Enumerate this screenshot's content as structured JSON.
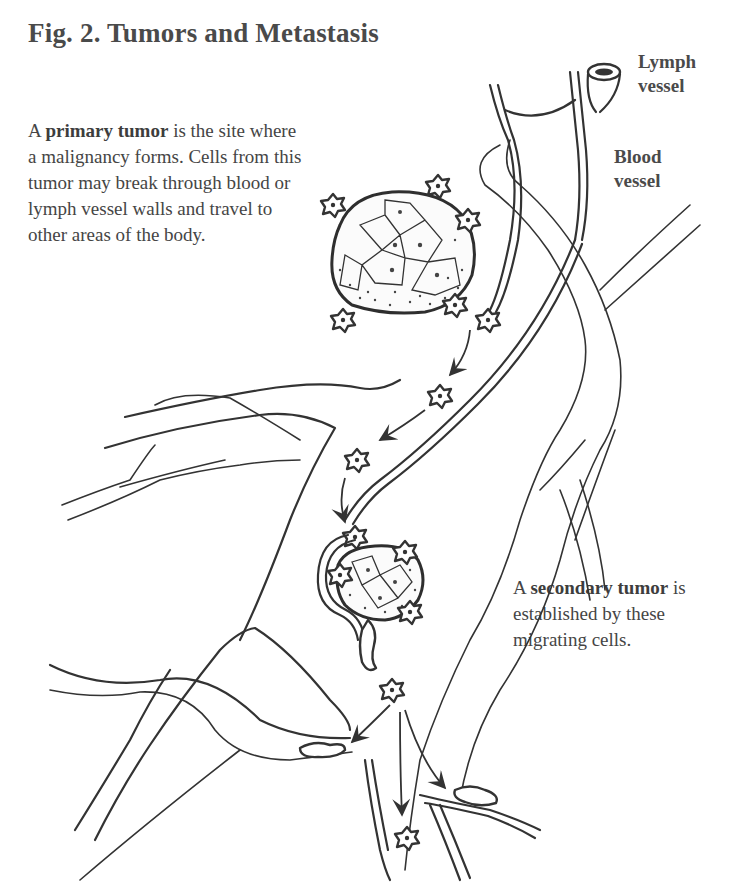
{
  "figure": {
    "title": "Fig. 2. Tumors and Metastasis"
  },
  "captions": {
    "primary": {
      "lead": "A ",
      "term": "primary tumor",
      "text": " is the site where a malignancy forms. Cells from this tumor may break through blood or lymph vessel walls and travel to other areas of the body."
    },
    "secondary": {
      "lead": "A ",
      "term": "secondary tumor",
      "text": " is established by these migrating cells."
    }
  },
  "labels": {
    "lymph_vessel": [
      "Lymph",
      "vessel"
    ],
    "blood_vessel": [
      "Blood",
      "vessel"
    ]
  },
  "illustration": {
    "elements": [
      "primary-tumor",
      "secondary-tumor",
      "lymph-vessel",
      "blood-vessel",
      "migrating-cells",
      "migration-arrows"
    ],
    "colors": {
      "ink": "#333333",
      "background": "#ffffff"
    }
  }
}
